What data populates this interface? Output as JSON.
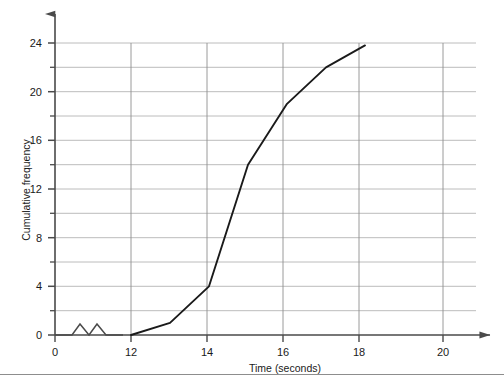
{
  "chart_data": {
    "type": "line",
    "title": "",
    "xlabel": "Time (seconds)",
    "ylabel": "Cumulative frequency",
    "xlim": [
      12,
      21.6
    ],
    "ylim": [
      0,
      25.4
    ],
    "grid": true,
    "legend": null,
    "axis_break": {
      "axis": "x",
      "symbol": "zigzag",
      "between": [
        0,
        12
      ]
    },
    "x_ticks_labeled": [
      "0",
      "12",
      "14",
      "16",
      "18",
      "20"
    ],
    "x_tick_values": [
      0,
      12,
      14,
      16,
      18,
      20
    ],
    "y_ticks_labeled": [
      "0",
      "4",
      "8",
      "12",
      "16",
      "20",
      "24"
    ],
    "y_tick_values": [
      0,
      4,
      8,
      12,
      16,
      20,
      24
    ],
    "y_minor_ticks": [
      2,
      6,
      10,
      14,
      18,
      22
    ],
    "x": [
      12,
      13,
      14,
      15,
      16,
      17,
      18
    ],
    "values": [
      0,
      1,
      4,
      14,
      19,
      22,
      23.8
    ],
    "series": [
      {
        "name": "Cumulative frequency",
        "x": [
          12,
          13,
          14,
          15,
          16,
          17,
          18
        ],
        "values": [
          0,
          1,
          4,
          14,
          19,
          22,
          23.8
        ]
      }
    ],
    "line_color": "#1a1a1a",
    "grid_color": "#b0b0b0",
    "axis_color": "#555555"
  }
}
